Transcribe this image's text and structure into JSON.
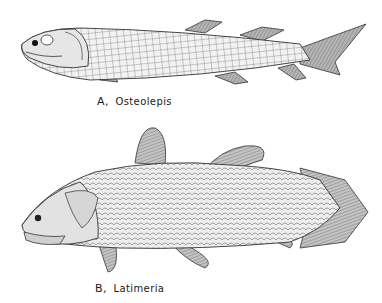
{
  "figures": [
    {
      "id": "A",
      "label": "A,",
      "name": "Osteolepis"
    },
    {
      "id": "B",
      "label": "B,",
      "name": "Latimeria"
    }
  ],
  "colors": {
    "ink": "#2a2a2a",
    "shade": "#9a9a9a",
    "paper": "#ffffff"
  }
}
